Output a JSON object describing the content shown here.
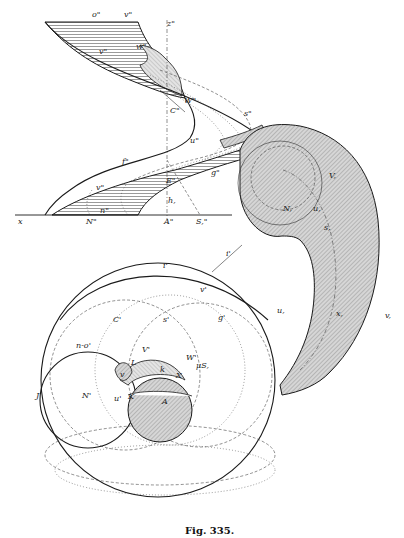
{
  "figure": {
    "caption": "Fig. 335.",
    "colors": {
      "ink": "#1a1a1a",
      "hatch_fill": "#cfcfcf",
      "paper": "#ffffff"
    },
    "elevation_labels": {
      "o2": "o\"",
      "v2_top": "v\"",
      "z2": "z\"",
      "v2_mid": "v\"",
      "w2": "w\"",
      "W2": "W\"",
      "C2": "C\"",
      "u2": "u\"",
      "s2": "s\"",
      "f2": "f\"",
      "v2_low": "v\"",
      "E2": "E\"",
      "g2": "g\"",
      "h1": "h,",
      "x_left": "x",
      "n2": "n\"",
      "N2": "N\"",
      "A2": "A\"",
      "S2": "S,\""
    },
    "spiral_labels": {
      "V1": "V,",
      "N1": "N,",
      "u1": "u,",
      "s1": "s,",
      "u_outer": "u,",
      "x1": "x,",
      "v1": "v,"
    },
    "plan_labels": {
      "i1": "i'",
      "i_top": "i'",
      "v_top": "v'",
      "C1": "C'",
      "s1p": "s'",
      "g1": "g'",
      "no1": "n-o'",
      "V1p": "V'",
      "W1": "W'",
      "J": "J",
      "v_left": "v",
      "L": "L",
      "k": "k",
      "X": "X",
      "N1p": "N'",
      "u1p": "u'",
      "K": "K",
      "A": "A",
      "muS": "μS,"
    }
  }
}
